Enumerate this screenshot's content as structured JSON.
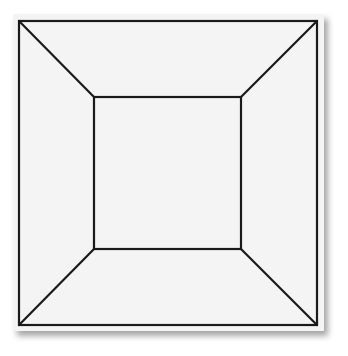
{
  "figure": {
    "colors": {
      "background": "#ffffff",
      "card_fill": "#f4f4f4",
      "stroke": "#1a1a1a"
    },
    "stroke_width": 2.2,
    "outer_square": {
      "x1": 19,
      "y1": 21,
      "x2": 317,
      "y2": 325
    },
    "inner_square": {
      "x1": 94,
      "y1": 97,
      "x2": 241,
      "y2": 249
    }
  }
}
